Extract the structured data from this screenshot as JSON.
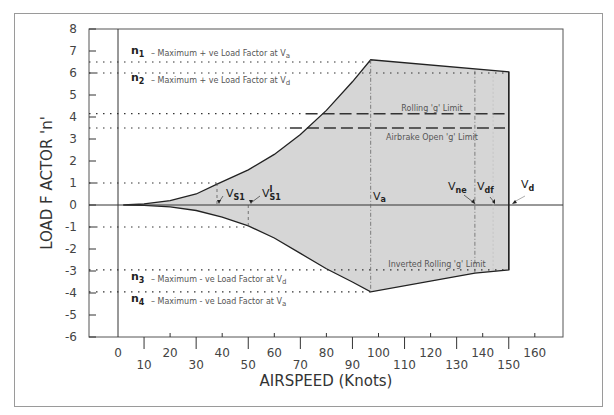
{
  "chart_data": {
    "type": "area",
    "title": "",
    "xlabel": "AIRSPEED (Knots)",
    "ylabel": "LOAD F ACTOR 'n'",
    "xlim": [
      -7,
      172
    ],
    "ylim": [
      -6,
      8
    ],
    "x_ticks_upper": [
      0,
      20,
      40,
      60,
      80,
      100,
      120,
      140,
      160
    ],
    "x_ticks_lower": [
      10,
      30,
      50,
      70,
      90,
      110,
      130,
      150
    ],
    "y_ticks": [
      8,
      7,
      6,
      5,
      4,
      3,
      2,
      1,
      0,
      -1,
      -2,
      -3,
      -4,
      -5,
      -6
    ],
    "grid": false,
    "envelope": {
      "upper_boundary": [
        [
          2,
          0
        ],
        [
          10,
          0.05
        ],
        [
          20,
          0.2
        ],
        [
          30,
          0.5
        ],
        [
          38,
          0.95
        ],
        [
          50,
          1.6
        ],
        [
          60,
          2.3
        ],
        [
          70,
          3.2
        ],
        [
          80,
          4.3
        ],
        [
          90,
          5.6
        ],
        [
          97,
          6.6
        ],
        [
          150,
          6.05
        ]
      ],
      "lower_boundary": [
        [
          2,
          0
        ],
        [
          10,
          -0.02
        ],
        [
          20,
          -0.08
        ],
        [
          30,
          -0.25
        ],
        [
          40,
          -0.55
        ],
        [
          50,
          -0.95
        ],
        [
          60,
          -1.5
        ],
        [
          70,
          -2.2
        ],
        [
          80,
          -2.9
        ],
        [
          90,
          -3.5
        ],
        [
          97,
          -3.95
        ],
        [
          137,
          -3.1
        ],
        [
          150,
          -2.95
        ]
      ],
      "fill_color": "#d6d6d6",
      "line_color": "#222222"
    },
    "reference_lines": [
      {
        "name": "n1",
        "y": 6.5,
        "style": "dotted",
        "label": "n1 – Maximum + ve Load Factor at Va"
      },
      {
        "name": "n2",
        "y": 6.0,
        "style": "dotted",
        "label": "n2 – Maximum + ve Load Factor at Vd"
      },
      {
        "name": "rolling_g_limit",
        "y": 4.15,
        "style": "dotted-then-dashed",
        "label": "Rolling 'g' Limit"
      },
      {
        "name": "airbrake_open_g_limit",
        "y": 3.5,
        "style": "dotted-then-dashed",
        "label": "Airbrake Open 'g' Limit"
      },
      {
        "name": "n_plus1",
        "y": 1.0,
        "style": "dotted"
      },
      {
        "name": "n_minus1",
        "y": -1.0,
        "style": "dotted"
      },
      {
        "name": "n3",
        "y": -2.95,
        "style": "dotted",
        "label": "n3 – Maximum - ve Load Factor at Vd"
      },
      {
        "name": "inverted_rolling_g_limit",
        "y": -2.95,
        "style": "dotted",
        "label": "Inverted Rolling 'g' Limit"
      },
      {
        "name": "n4",
        "y": -3.95,
        "style": "dotted",
        "label": "n4 – Maximum - ve Load Factor at Va"
      }
    ],
    "speeds": [
      {
        "name": "Vs1",
        "x": 38,
        "label": "VS1"
      },
      {
        "name": "V's1",
        "x": 50,
        "label": "V'S1"
      },
      {
        "name": "Va",
        "x": 97,
        "label": "Va"
      },
      {
        "name": "Vne",
        "x": 137,
        "label": "Vne"
      },
      {
        "name": "Vdf",
        "x": 144,
        "label": "Vdf"
      },
      {
        "name": "Vd",
        "x": 150,
        "label": "Vd"
      }
    ]
  },
  "labels": {
    "y_axis_title": "LOAD F ACTOR 'n'",
    "x_axis_title": "AIRSPEED (Knots)",
    "n1_main": "n",
    "n1_sub": "1",
    "n1_text": "– Maximum + ve Load Factor at V",
    "n1_text_sub": "a",
    "n2_main": "n",
    "n2_sub": "2",
    "n2_text": "– Maximum + ve Load Factor at V",
    "n2_text_sub": "d",
    "n3_main": "n",
    "n3_sub": "3",
    "n3_text": "– Maximum - ve Load Factor at V",
    "n3_text_sub": "d",
    "n4_main": "n",
    "n4_sub": "4",
    "n4_text": "– Maximum - ve Load Factor at V",
    "n4_text_sub": "a",
    "rolling": "Rolling 'g' Limit",
    "airbrake": "Airbrake Open 'g' Limit",
    "inverted": "Inverted Rolling 'g' Limit",
    "vs1_main": "V",
    "vs1_sub": "S1",
    "vs1p_main": "V",
    "vs1p_sup": "I",
    "vs1p_sub": "S1",
    "va_main": "V",
    "va_sub": "a",
    "vne_main": "V",
    "vne_sub": "ne",
    "vdf_main": "V",
    "vdf_sub": "df",
    "vd_main": "V",
    "vd_sub": "d"
  },
  "y_tick_labels": [
    "8",
    "7",
    "6",
    "5",
    "4",
    "3",
    "2",
    "1",
    "0",
    "-1",
    "-2",
    "-3",
    "-4",
    "-5",
    "-6"
  ],
  "x_tick_labels_upper": [
    "0",
    "20",
    "40",
    "60",
    "80",
    "100",
    "120",
    "140",
    "160"
  ],
  "x_tick_labels_lower": [
    "10",
    "30",
    "50",
    "70",
    "90",
    "110",
    "130",
    "150"
  ]
}
